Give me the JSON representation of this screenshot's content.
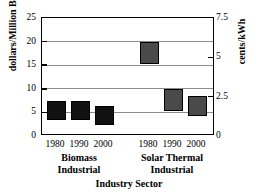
{
  "chart_data": {
    "type": "bar",
    "title": "",
    "xlabel": "Industry Sector",
    "ylabel": "dollars/Million Btu",
    "y2label": "cents/kWh",
    "ylim": [
      0,
      25
    ],
    "y2lim": [
      0,
      7.5
    ],
    "yticks": [
      0,
      5,
      10,
      15,
      20,
      25
    ],
    "y2ticks": [
      0,
      2.5,
      5,
      7.5
    ],
    "grid": true,
    "legend": "none",
    "bar_style": "floating range bars (high-low)",
    "groups": [
      {
        "name": "Biomass Industrial",
        "label_lines": [
          "Biomass",
          "Industrial"
        ],
        "color": "#111111",
        "categories": [
          "1980",
          "1990",
          "2000"
        ],
        "bars": [
          {
            "category": "1980",
            "low": 3.3,
            "high": 7.4
          },
          {
            "category": "1990",
            "low": 3.3,
            "high": 7.4
          },
          {
            "category": "2000",
            "low": 2.4,
            "high": 6.3
          }
        ]
      },
      {
        "name": "Solar Thermal Industrial",
        "label_lines": [
          "Solar Thermal",
          "Industrial"
        ],
        "color": "#4a4a4a",
        "categories": [
          "1980",
          "1990",
          "2000"
        ],
        "bars": [
          {
            "category": "1980",
            "low": 15.2,
            "high": 20.0
          },
          {
            "category": "1990",
            "low": 5.4,
            "high": 10.0
          },
          {
            "category": "2000",
            "low": 4.3,
            "high": 8.5
          }
        ]
      }
    ]
  },
  "axes": {
    "left_title": "dollars/Million Btu",
    "right_title": "cents/kWh",
    "bottom_title": "Industry Sector",
    "left_ticks": [
      "25",
      "20",
      "15",
      "10",
      "5",
      "0"
    ],
    "right_ticks": [
      "7.5",
      "5",
      "2.5",
      "0"
    ]
  },
  "xticks": [
    "1980",
    "1990",
    "2000",
    "1980",
    "1990",
    "2000"
  ],
  "group_labels": [
    {
      "line1": "Biomass",
      "line2": "Industrial"
    },
    {
      "line1": "Solar Thermal",
      "line2": "Industrial"
    }
  ]
}
